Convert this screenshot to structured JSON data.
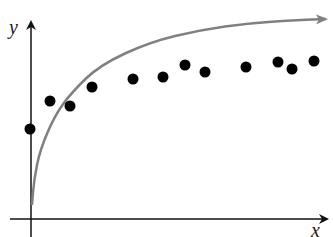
{
  "chart_data": {
    "type": "scatter",
    "title": "",
    "xlabel": "x",
    "ylabel": "y",
    "grid": false,
    "legend": null,
    "ticks": {
      "x": [],
      "y": []
    },
    "axis_range_px": {
      "x": [
        10,
        327
      ],
      "y": [
        237,
        20
      ]
    },
    "points_px": [
      {
        "x": 30,
        "y": 129
      },
      {
        "x": 50,
        "y": 101
      },
      {
        "x": 70,
        "y": 106
      },
      {
        "x": 92,
        "y": 87
      },
      {
        "x": 133,
        "y": 79
      },
      {
        "x": 163,
        "y": 77
      },
      {
        "x": 185,
        "y": 65
      },
      {
        "x": 205,
        "y": 72
      },
      {
        "x": 246,
        "y": 67
      },
      {
        "x": 278,
        "y": 62
      },
      {
        "x": 292,
        "y": 69
      },
      {
        "x": 314,
        "y": 61
      }
    ],
    "series": [
      {
        "name": "data points",
        "kind": "scatter",
        "note": "values are relative heights above x-axis (x-axis at pixel y=219), x measured from y-axis at pixel x=31",
        "x": [
          -1,
          19,
          39,
          61,
          102,
          132,
          154,
          174,
          215,
          247,
          261,
          283
        ],
        "y": [
          90,
          118,
          113,
          132,
          140,
          142,
          154,
          147,
          152,
          157,
          150,
          158
        ]
      },
      {
        "name": "fitted curve",
        "kind": "line",
        "shape": "concave increasing, approaching horizontal asymptote, arrow at right end",
        "color": "#808080",
        "path_px": [
          [
            32,
            205
          ],
          [
            34,
            180
          ],
          [
            40,
            150
          ],
          [
            55,
            115
          ],
          [
            72,
            92
          ],
          [
            100,
            65
          ],
          [
            150,
            42
          ],
          [
            200,
            30
          ],
          [
            250,
            23
          ],
          [
            300,
            20
          ],
          [
            326,
            19
          ]
        ]
      }
    ]
  },
  "labels": {
    "x_axis": "x",
    "y_axis": "y"
  },
  "colors": {
    "axis": "#111111",
    "curve": "#808080",
    "points": "#000000"
  }
}
